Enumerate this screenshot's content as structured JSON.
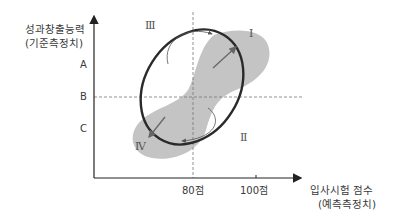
{
  "diagram": {
    "y_axis": {
      "title_line1": "성과창출능력",
      "title_line2": "(기준측정치)",
      "levels": [
        "A",
        "B",
        "C"
      ]
    },
    "x_axis": {
      "title_line1": "입사시험 점수",
      "title_line2": "(예측측정치)",
      "ticks": [
        "80점",
        "100점"
      ]
    },
    "quadrants": {
      "q1": "Ⅰ",
      "q2": "Ⅱ",
      "q3": "Ⅲ",
      "q4": "Ⅳ"
    },
    "colors": {
      "axis": "#222222",
      "dashed": "#777777",
      "shaded_region": "#c4c4c4",
      "ellipse": "#2a2a2a",
      "arrows": "#666666"
    }
  }
}
